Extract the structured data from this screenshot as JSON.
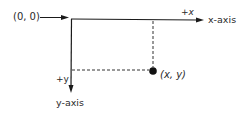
{
  "diagram": {
    "origin_label": "(0, 0)",
    "x_direction_label": "+x",
    "x_axis_label": "x-axis",
    "y_direction_label": "+y",
    "y_axis_label": "y-axis",
    "point_label": "(x, y)"
  },
  "colors": {
    "line": "#1a1a1a",
    "dashed": "#333333",
    "text": "#2a2a2a",
    "background": "#ffffff"
  }
}
